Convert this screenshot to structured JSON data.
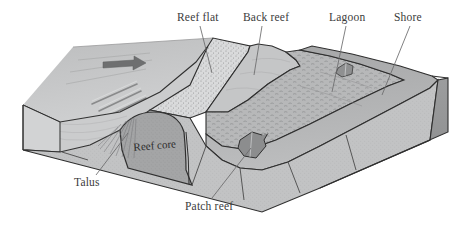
{
  "diagram": {
    "type": "geological-block-diagram",
    "labels": {
      "reef_flat": "Reef flat",
      "back_reef": "Back reef",
      "lagoon": "Lagoon",
      "shore": "Shore",
      "talus": "Talus",
      "reef_core": "Reef core",
      "patch_reef": "Patch reef"
    },
    "colors": {
      "background": "#ffffff",
      "ocean_surface": "#b9babb",
      "fore_reef_slope": "#c9cacb",
      "reef_flat": "#d6d7d8",
      "back_reef": "#c4c5c6",
      "lagoon": "#b5b6b7",
      "shore_slope": "#a8a9aa",
      "block_front_face": "#c0c1c2",
      "block_right_face": "#999a9b",
      "block_left_face": "#d0d1d2",
      "reef_core": "#9d9e9f",
      "patch_reef": "#8e8f90",
      "outline": "#2b2b2b",
      "label_text": "#3b3b3b",
      "leader_line": "#5a5a5a"
    },
    "features": {
      "wave_direction_arrow": "arrow-icon",
      "spur_and_groove": "groove-lines",
      "lagoon_patch_reef_count": 2
    }
  }
}
